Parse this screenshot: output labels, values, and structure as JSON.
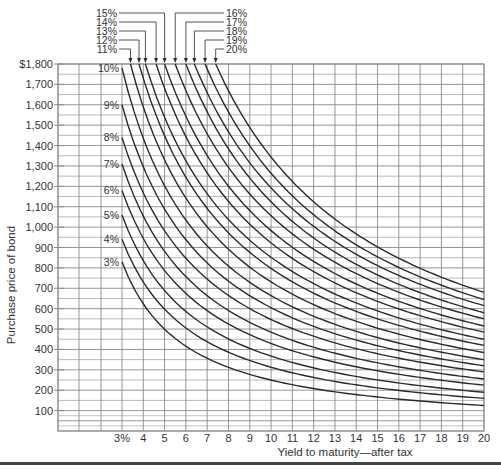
{
  "chart_data": {
    "type": "line",
    "title": "",
    "xlabel": "Yield to maturity—after tax",
    "ylabel": "Purchase price of bond",
    "x_tick_labels": [
      "3%",
      "4",
      "5",
      "6",
      "7",
      "8",
      "9",
      "10",
      "11",
      "12",
      "13",
      "14",
      "15",
      "16",
      "17",
      "18",
      "19",
      "20"
    ],
    "x_ticks": [
      3,
      4,
      5,
      6,
      7,
      8,
      9,
      10,
      11,
      12,
      13,
      14,
      15,
      16,
      17,
      18,
      19,
      20
    ],
    "y_tick_labels": [
      "$1,800",
      "1,700",
      "1,600",
      "1,500",
      "1,400",
      "1,300",
      "1,200",
      "1,100",
      "1,000",
      "900",
      "800",
      "700",
      "600",
      "500",
      "400",
      "300",
      "200",
      "100"
    ],
    "y_ticks": [
      1800,
      1700,
      1600,
      1500,
      1400,
      1300,
      1200,
      1100,
      1000,
      900,
      800,
      700,
      600,
      500,
      400,
      300,
      200,
      100
    ],
    "xlim": [
      0,
      20
    ],
    "ylim": [
      0,
      1800
    ],
    "grid": true,
    "legend_position": "inline labels; 3%–10% at left of curves, 11%–20% at top with arrows",
    "series": [
      {
        "name": "3%",
        "start_yield": 3,
        "start_price": 830,
        "end_price": 125
      },
      {
        "name": "4%",
        "start_yield": 3,
        "start_price": 940,
        "end_price": 160
      },
      {
        "name": "5%",
        "start_yield": 3,
        "start_price": 1060,
        "end_price": 190
      },
      {
        "name": "6%",
        "start_yield": 3,
        "start_price": 1180,
        "end_price": 225
      },
      {
        "name": "7%",
        "start_yield": 3,
        "start_price": 1310,
        "end_price": 255
      },
      {
        "name": "8%",
        "start_yield": 3,
        "start_price": 1440,
        "end_price": 290
      },
      {
        "name": "9%",
        "start_yield": 3,
        "start_price": 1600,
        "end_price": 320
      },
      {
        "name": "10%",
        "start_yield": 3,
        "start_price": 1780,
        "end_price": 350
      },
      {
        "name": "11%",
        "start_yield": 3.4,
        "start_price": 1800,
        "end_price": 385
      },
      {
        "name": "12%",
        "start_yield": 3.8,
        "start_price": 1800,
        "end_price": 420
      },
      {
        "name": "13%",
        "start_yield": 4.1,
        "start_price": 1800,
        "end_price": 450
      },
      {
        "name": "14%",
        "start_yield": 4.6,
        "start_price": 1800,
        "end_price": 485
      },
      {
        "name": "15%",
        "start_yield": 5.0,
        "start_price": 1800,
        "end_price": 515
      },
      {
        "name": "16%",
        "start_yield": 5.5,
        "start_price": 1800,
        "end_price": 550
      },
      {
        "name": "17%",
        "start_yield": 6.0,
        "start_price": 1800,
        "end_price": 580
      },
      {
        "name": "18%",
        "start_yield": 6.4,
        "start_price": 1800,
        "end_price": 615
      },
      {
        "name": "19%",
        "start_yield": 6.9,
        "start_price": 1800,
        "end_price": 645
      },
      {
        "name": "20%",
        "start_yield": 7.4,
        "start_price": 1800,
        "end_price": 680
      }
    ]
  },
  "labels": {
    "left_curve_labels": [
      "10%",
      "9%",
      "8%",
      "7%",
      "6%",
      "5%",
      "4%",
      "3%"
    ],
    "top_left_labels": [
      "15%",
      "14%",
      "13%",
      "12%",
      "11%"
    ],
    "top_right_labels": [
      "16%",
      "17%",
      "18%",
      "19%",
      "20%"
    ]
  },
  "colors": {
    "line": "#2a2a2a",
    "grid": "#8a8a8a",
    "text": "#333333"
  }
}
